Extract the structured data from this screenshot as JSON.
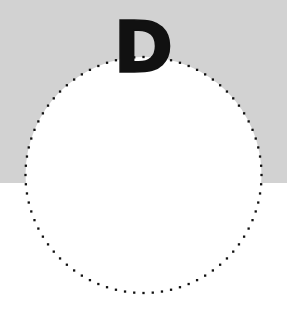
{
  "figure": {
    "title_letter": "D",
    "width": 287,
    "height": 315,
    "background": {
      "top_color": "#d2d2d2",
      "bottom_color": "#ffffff",
      "split_y": 183
    }
  },
  "letter_label": {
    "text": "D",
    "color": "#111111",
    "font_size_px": 72,
    "weight": "bold",
    "center_x": 146,
    "top_y": 22,
    "bottom_y": 73
  },
  "chart_data": {
    "type": "scatter",
    "title": "D",
    "subtitle": "",
    "xlabel": "",
    "ylabel": "",
    "grid": false,
    "legend_position": "none",
    "shape": "circle",
    "marker": "square",
    "marker_color": "#111111",
    "marker_size_px": 2.3,
    "fill_color": "#ffffff",
    "center": [
      143.5,
      175
    ],
    "radius": 118,
    "point_count": 80,
    "angle_start_deg": -90,
    "angle_step_deg": 4.5,
    "xlim": [
      0,
      287
    ],
    "ylim": [
      0,
      315
    ],
    "annotations": [
      {
        "text": "D",
        "x": 146,
        "y": 47
      }
    ]
  }
}
